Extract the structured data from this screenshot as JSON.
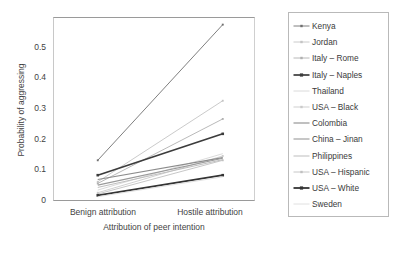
{
  "chart_data": {
    "type": "line",
    "title": "",
    "xlabel": "Attribution of peer intention",
    "ylabel": "Probability of aggressing",
    "categories": [
      "Benign attribution",
      "Hostile attribution"
    ],
    "x": [
      0,
      1
    ],
    "xlim": [
      -0.35,
      1.25
    ],
    "ylim": [
      0,
      0.55
    ],
    "yticks": [
      "0",
      "0.1",
      "0.2",
      "0.3",
      "0.4",
      "0.5"
    ],
    "ytick_values": [
      0,
      0.1,
      0.2,
      0.3,
      0.4,
      0.5
    ],
    "grid": false,
    "legend_position": "right",
    "markers": "small squares at both endpoints",
    "series": [
      {
        "name": "Kenya",
        "values": [
          0.12,
          0.53
        ],
        "color": "#6f6f6f",
        "width": 0.9,
        "marker": true
      },
      {
        "name": "Jordan",
        "values": [
          0.055,
          0.3
        ],
        "color": "#c4c4c4",
        "width": 0.9,
        "marker": true
      },
      {
        "name": "Italy – Rome",
        "values": [
          0.05,
          0.245
        ],
        "color": "#b0b0b0",
        "width": 0.9,
        "marker": true
      },
      {
        "name": "Italy – Naples",
        "values": [
          0.075,
          0.2
        ],
        "color": "#3c3c3c",
        "width": 1.7,
        "marker": true
      },
      {
        "name": "Thailand",
        "values": [
          0.03,
          0.14
        ],
        "color": "#d6d6d6",
        "width": 0.9,
        "marker": false
      },
      {
        "name": "USA – Black",
        "values": [
          0.022,
          0.133
        ],
        "color": "#cacaca",
        "width": 0.9,
        "marker": true
      },
      {
        "name": "Colombia",
        "values": [
          0.062,
          0.128
        ],
        "color": "#8c8c8c",
        "width": 1.1,
        "marker": false
      },
      {
        "name": "China – Jinan",
        "values": [
          0.045,
          0.126
        ],
        "color": "#9a9a9a",
        "width": 1.1,
        "marker": false
      },
      {
        "name": "Philippines",
        "values": [
          0.038,
          0.122
        ],
        "color": "#bdbdbd",
        "width": 1.0,
        "marker": false
      },
      {
        "name": "USA – Hispanic",
        "values": [
          0.018,
          0.12
        ],
        "color": "#c0c0c0",
        "width": 0.9,
        "marker": true
      },
      {
        "name": "USA – White",
        "values": [
          0.014,
          0.075
        ],
        "color": "#343434",
        "width": 1.8,
        "marker": true
      },
      {
        "name": "Sweden",
        "values": [
          0.01,
          0.07
        ],
        "color": "#dcdcdc",
        "width": 0.9,
        "marker": false
      }
    ]
  },
  "legend": {
    "items": [
      {
        "label": "Kenya"
      },
      {
        "label": "Jordan"
      },
      {
        "label": "Italy – Rome"
      },
      {
        "label": "Italy – Naples"
      },
      {
        "label": "Thailand"
      },
      {
        "label": "USA – Black"
      },
      {
        "label": "Colombia"
      },
      {
        "label": "China – Jinan"
      },
      {
        "label": "Philippines"
      },
      {
        "label": "USA – Hispanic"
      },
      {
        "label": "USA – White"
      },
      {
        "label": "Sweden"
      }
    ]
  }
}
